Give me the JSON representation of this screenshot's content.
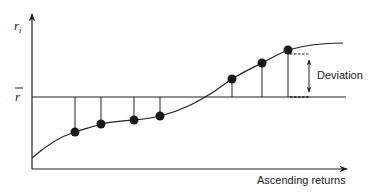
{
  "diagram": {
    "y_axis_label": "r",
    "y_axis_subscript": "i",
    "mean_label": "r",
    "x_axis_label": "Ascending returns",
    "annotation_label": "Deviation",
    "colors": {
      "ink": "#222222",
      "dot": "#1a1a1a",
      "background": "#ffffff"
    },
    "points": [
      {
        "x": 75,
        "y": 132
      },
      {
        "x": 101,
        "y": 124
      },
      {
        "x": 134,
        "y": 120
      },
      {
        "x": 160,
        "y": 116
      },
      {
        "x": 232,
        "y": 79
      },
      {
        "x": 262,
        "y": 63
      },
      {
        "x": 288,
        "y": 50
      }
    ],
    "mean_line_y": 97
  }
}
